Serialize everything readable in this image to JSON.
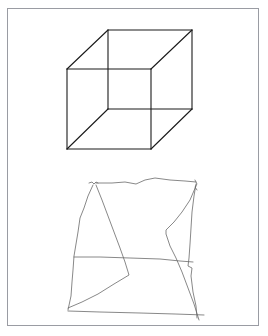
{
  "figure": {
    "frame_color": "#9a9ca3",
    "background": "#ffffff",
    "panels": [
      {
        "name": "reference-cube",
        "description": "Necker cube wireframe (printed reference)",
        "stroke_color": "#1a1a1a",
        "vertices": {
          "front_top_left": [
            67,
            69
          ],
          "front_top_right": [
            151,
            69
          ],
          "front_bottom_left": [
            67,
            149
          ],
          "front_bottom_right": [
            151,
            149
          ],
          "back_top_left": [
            108,
            30
          ],
          "back_top_right": [
            192,
            30
          ],
          "back_bottom_left": [
            108,
            109
          ],
          "back_bottom_right": [
            192,
            109
          ]
        }
      },
      {
        "name": "hand-drawn-copy",
        "description": "Freehand attempt at copying the cube",
        "stroke_color": "#6a6a6a"
      }
    ]
  }
}
